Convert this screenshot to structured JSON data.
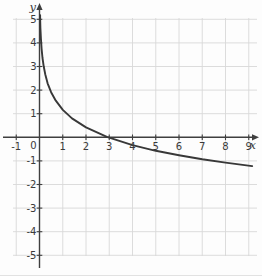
{
  "page": {
    "background": "#fdfdfd"
  },
  "chart_data": {
    "type": "line",
    "subtype": "logarithmic-decreasing-curve",
    "title": "",
    "grid": "on",
    "legend": "none",
    "x_axis": {
      "label": "x",
      "arrow": "right",
      "range": [
        -1.7,
        9.7
      ],
      "tick_values": [
        -1,
        1,
        2,
        3,
        4,
        5,
        6,
        7,
        8,
        9
      ],
      "tick_labels": [
        "-1",
        "1",
        "2",
        "3",
        "4",
        "5",
        "6",
        "7",
        "8",
        "9"
      ]
    },
    "y_axis": {
      "label": "y",
      "arrow": "up",
      "range": [
        -5.8,
        5.8
      ],
      "tick_values": [
        5,
        4,
        3,
        2,
        1,
        -1,
        -2,
        -3,
        -4,
        -5
      ],
      "tick_labels": [
        "5",
        "4",
        "3",
        "2",
        "1",
        "-1",
        "-2",
        "-3",
        "-4",
        "-5"
      ]
    },
    "origin_label": "0",
    "series": [
      {
        "name": "curve",
        "style": "solid",
        "x_intercept_approx": 2.9,
        "y_value_at_x1": 1.16,
        "end_point_approx": [
          9.1,
          -1.22
        ],
        "points": [
          [
            0.024,
            5.18
          ],
          [
            0.03,
            4.94
          ],
          [
            0.04,
            4.63
          ],
          [
            0.06,
            4.19
          ],
          [
            0.09,
            3.75
          ],
          [
            0.13,
            3.36
          ],
          [
            0.18,
            3.01
          ],
          [
            0.25,
            2.66
          ],
          [
            0.35,
            2.29
          ],
          [
            0.5,
            1.91
          ],
          [
            0.7,
            1.55
          ],
          [
            1.0,
            1.16
          ],
          [
            1.4,
            0.8
          ],
          [
            2.0,
            0.42
          ],
          [
            2.9,
            0.02
          ],
          [
            4.0,
            -0.33
          ],
          [
            5.0,
            -0.57
          ],
          [
            6.0,
            -0.76
          ],
          [
            7.0,
            -0.93
          ],
          [
            8.0,
            -1.07
          ],
          [
            9.15,
            -1.22
          ]
        ]
      }
    ],
    "colors": {
      "curve": "#383838",
      "axis": "#3f3f3f",
      "grid": "#d8d8d8",
      "text": "#3a3a3a",
      "background": "#fdfdfd"
    }
  }
}
